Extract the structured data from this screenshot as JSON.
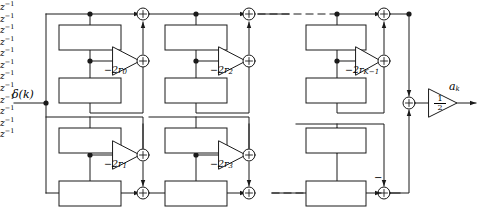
{
  "figure": {
    "input_label": "δ(k)",
    "output_label": "a",
    "output_label_sub": "k",
    "output_gain_num": "1",
    "output_gain_den": "2",
    "delay_label": "z",
    "delay_label_sup": "−1",
    "final_adder_sign": "−",
    "adder_plus": "+",
    "colors": {
      "line": "#1a1a1a",
      "background": "#ffffff",
      "text": "#000000"
    }
  },
  "sections": [
    {
      "id": "section-0",
      "row": "top",
      "index": 0,
      "coefficient": "−2r",
      "coefficient_sub": "0",
      "delays": [
        "z⁻¹",
        "z⁻¹"
      ],
      "adders": 2
    },
    {
      "id": "section-2",
      "row": "top",
      "index": 2,
      "coefficient": "−2r",
      "coefficient_sub": "2",
      "delays": [
        "z⁻¹",
        "z⁻¹"
      ],
      "adders": 2
    },
    {
      "id": "section-k-1",
      "row": "top",
      "index": "K−1",
      "coefficient": "−2r",
      "coefficient_sub": "K−1",
      "delays": [
        "z⁻¹",
        "z⁻¹"
      ],
      "adders": 2
    },
    {
      "id": "section-1",
      "row": "bottom",
      "index": 1,
      "coefficient": "−2r",
      "coefficient_sub": "1",
      "delays": [
        "z⁻¹",
        "z⁻¹"
      ],
      "adders": 2
    },
    {
      "id": "section-3",
      "row": "bottom",
      "index": 3,
      "coefficient": "−2r",
      "coefficient_sub": "3",
      "delays": [
        "z⁻¹",
        "z⁻¹"
      ],
      "adders": 2
    },
    {
      "id": "section-bottom-last",
      "row": "bottom",
      "index": "last",
      "coefficient": "",
      "coefficient_sub": "",
      "delays": [
        "z⁻¹",
        "z⁻¹"
      ],
      "adders": 1
    }
  ],
  "continuation": {
    "top_dashes": "– – –",
    "bottom_dashes": "– – –"
  }
}
